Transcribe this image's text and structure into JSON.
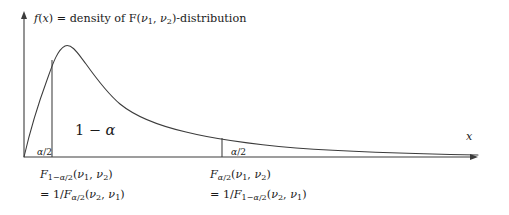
{
  "figure": {
    "title_segments": [
      {
        "text": "f",
        "style": "italic"
      },
      {
        "text": "(",
        "style": "upright"
      },
      {
        "text": "x",
        "style": "italic"
      },
      {
        "text": ") = density of F(",
        "style": "upright"
      },
      {
        "text": "ν",
        "style": "italic"
      },
      {
        "text": "1",
        "style": "sub"
      },
      {
        "text": ", ",
        "style": "upright"
      },
      {
        "text": "ν",
        "style": "italic"
      },
      {
        "text": "2",
        "style": "sub"
      },
      {
        "text": ")-distribution",
        "style": "upright"
      }
    ],
    "title_plain": "f(x) = density of F(ν1, ν2)-distribution",
    "x_axis_label": "x",
    "y_axis_label": "",
    "central_region_label": "1 − α",
    "left_tail_label": "α/2",
    "right_tail_label": "α/2",
    "left_quantile_line1": "F1−α/2(ν1, ν2)",
    "left_quantile_line2": "= 1/Fα/2(ν2, ν1)",
    "right_quantile_line1": "Fα/2(ν1, ν2)",
    "right_quantile_line2": "= 1/F1−α/2(ν2, ν1)",
    "stroke_color": "#3c3c3c",
    "text_color": "#1a1a1a",
    "background_color": "#ffffff"
  },
  "chart_data": {
    "type": "line",
    "title": "f(x) = density of F(ν1, ν2)-distribution",
    "xlabel": "x",
    "ylabel": "f(x)",
    "grid": false,
    "legend": "none",
    "curve_name": "F(ν1, ν2) density",
    "axis_pixels": {
      "origin_x": 24,
      "baseline_y": 157,
      "y_axis_top": 14,
      "x_axis_right": 478
    },
    "xlim": [
      0,
      478
    ],
    "ylim": [
      0,
      157
    ],
    "annotations": [
      {
        "label": "1 − α",
        "x": 98,
        "y": 130,
        "role": "central-probability"
      },
      {
        "label": "α/2",
        "x": 34,
        "y": 152,
        "role": "left-tail-probability"
      },
      {
        "label": "α/2",
        "x": 228,
        "y": 152,
        "role": "right-tail-probability"
      },
      {
        "label": "x",
        "x": 470,
        "y": 136,
        "role": "x-axis-label"
      }
    ],
    "quantile_markers": [
      {
        "name": "lower-quantile",
        "x_pixel": 52,
        "y_top_pixel": 60,
        "label_line1": "F1−α/2(ν1, ν2)",
        "label_line2": "= 1/Fα/2(ν2, ν1)"
      },
      {
        "name": "upper-quantile",
        "x_pixel": 222,
        "y_top_pixel": 138,
        "label_line1": "Fα/2(ν1, ν2)",
        "label_line2": "= 1/F1−α/2(ν2, ν1)"
      }
    ],
    "curve_points": [
      [
        24,
        157
      ],
      [
        28,
        140
      ],
      [
        32,
        124
      ],
      [
        36,
        109
      ],
      [
        40,
        95
      ],
      [
        44,
        82
      ],
      [
        48,
        70
      ],
      [
        52,
        60
      ],
      [
        56,
        52
      ],
      [
        60,
        48
      ],
      [
        64,
        46
      ],
      [
        68,
        46
      ],
      [
        73,
        48
      ],
      [
        78,
        52
      ],
      [
        84,
        58
      ],
      [
        90,
        65
      ],
      [
        96,
        72
      ],
      [
        103,
        80
      ],
      [
        110,
        88
      ],
      [
        118,
        95
      ],
      [
        126,
        102
      ],
      [
        134,
        108
      ],
      [
        142,
        113
      ],
      [
        150,
        117
      ],
      [
        158,
        121
      ],
      [
        166,
        124
      ],
      [
        175,
        127
      ],
      [
        184,
        130
      ],
      [
        194,
        133
      ],
      [
        204,
        135
      ],
      [
        214,
        137
      ],
      [
        222,
        138
      ],
      [
        234,
        140
      ],
      [
        248,
        142
      ],
      [
        264,
        144
      ],
      [
        282,
        146
      ],
      [
        302,
        147
      ],
      [
        324,
        149
      ],
      [
        348,
        150
      ],
      [
        374,
        151
      ],
      [
        402,
        152
      ],
      [
        432,
        153
      ],
      [
        462,
        154
      ],
      [
        478,
        155
      ]
    ],
    "curve_path_d": "M 24 157 C 30 131 40 99 47 80 C 52 66 57 50 65 46 C 72 43 79 55 86 64 C 96 78 107 93 120 104 C 136 117 160 126 186 132 C 214 139 250 144 296 148 C 350 152 420 154 478 155"
  }
}
